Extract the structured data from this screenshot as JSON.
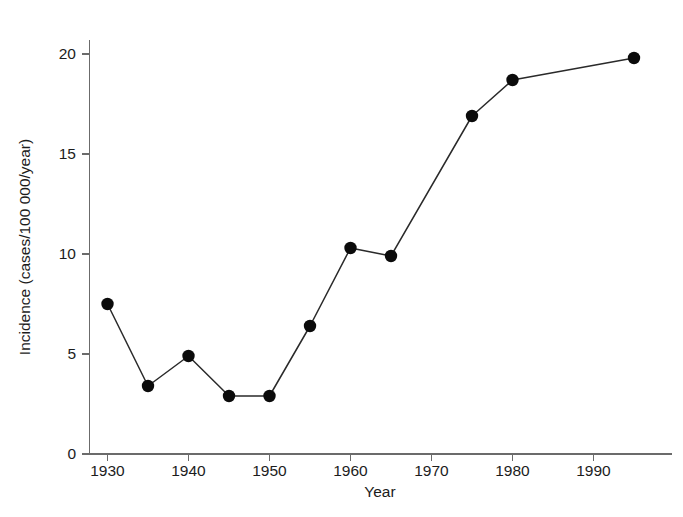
{
  "chart_data": {
    "type": "line",
    "title": "",
    "xlabel": "Year",
    "ylabel": "Incidence (cases/100 000/year)",
    "x": [
      1930,
      1935,
      1940,
      1945,
      1950,
      1955,
      1960,
      1965,
      1975,
      1980,
      1995
    ],
    "values": [
      7.5,
      3.4,
      4.9,
      2.9,
      2.9,
      6.4,
      10.3,
      9.9,
      16.9,
      18.7,
      19.8
    ],
    "series": [
      {
        "name": "Incidence",
        "x": [
          1930,
          1935,
          1940,
          1945,
          1950,
          1955,
          1960,
          1965,
          1975,
          1980,
          1995
        ],
        "values": [
          7.5,
          3.4,
          4.9,
          2.9,
          2.9,
          6.4,
          10.3,
          9.9,
          16.9,
          18.7,
          19.8
        ]
      }
    ],
    "xlim": [
      1926,
      1999
    ],
    "ylim": [
      0,
      21
    ],
    "xticks": [
      1930,
      1940,
      1950,
      1960,
      1970,
      1980,
      1990
    ],
    "xtick_labels": [
      "1930",
      "1940",
      "1950",
      "1960",
      "1970",
      "1980",
      "1990"
    ],
    "yticks": [
      0,
      5,
      10,
      15,
      20
    ],
    "ytick_labels": [
      "0",
      "5",
      "10",
      "15",
      "20"
    ],
    "grid": false,
    "legend": "none",
    "marker": "filled-circle",
    "line_color": "#2a2a2a",
    "marker_color": "#0b0b0b",
    "axis_color": "#6b6b6b",
    "background_color": "#ffffff"
  },
  "axes": {
    "x_title": "Year",
    "y_title": "Incidence (cases/100 000/year)"
  }
}
